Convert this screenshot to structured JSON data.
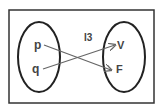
{
  "diagram": {
    "type": "function-mapping",
    "label": "I3",
    "domain_set": {
      "elements": [
        "p",
        "q"
      ]
    },
    "codomain_set": {
      "elements": [
        "V",
        "F"
      ]
    },
    "mappings": [
      {
        "from": "p",
        "to": "F"
      },
      {
        "from": "q",
        "to": "V"
      }
    ],
    "colors": {
      "border": "#333333",
      "ellipse": "#222222",
      "arrow": "#666666",
      "text": "#444444",
      "background": "#ffffff"
    }
  }
}
